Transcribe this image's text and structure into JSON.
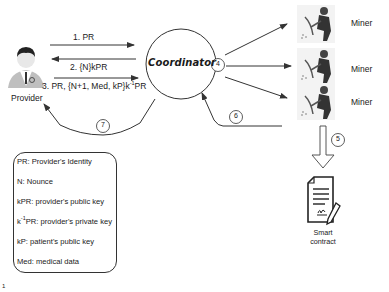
{
  "nodes": {
    "provider": {
      "label": "Provider"
    },
    "coordinator": {
      "label": "Coordinator"
    },
    "miners": [
      {
        "label": "Miner"
      },
      {
        "label": "Miner"
      },
      {
        "label": "Miner"
      }
    ],
    "smart_contract": {
      "label_line1": "Smart",
      "label_line2": "contract"
    }
  },
  "messages": {
    "m1": "1. PR",
    "m2": "2. {N}kPR",
    "m3_prefix": "3. PR, {N+1, Med, kP}k",
    "m3_sup": "-1",
    "m3_suffix": "PR"
  },
  "steps": {
    "s4": "4",
    "s5": "5",
    "s6": "6",
    "s7": "7"
  },
  "legend": {
    "items": [
      {
        "text": "PR: Provider's Identity"
      },
      {
        "text": "N: Nounce"
      },
      {
        "text": "kPR: provider's public key"
      },
      {
        "prefix": "k",
        "sup": "-1",
        "text": "PR: provider's private key"
      },
      {
        "text": "kP: patient's public key"
      },
      {
        "text": "Med: medical data"
      }
    ]
  },
  "corner_mark": "1",
  "colors": {
    "line": "#333333",
    "text": "#1a1a1a",
    "miner_bg": "#f0f0f0"
  }
}
